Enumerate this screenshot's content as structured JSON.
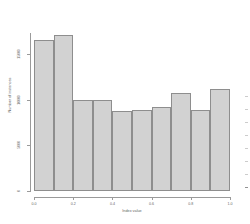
{
  "chart_data": {
    "type": "bar",
    "title": "",
    "subtitle": "",
    "xlabel": "Index value",
    "ylabel": "Number of instances",
    "xlim": [
      0.0,
      1.0
    ],
    "ylim": [
      0,
      20000
    ],
    "grid": false,
    "legend": null,
    "bin_edges": [
      0.0,
      0.1,
      0.2,
      0.3,
      0.4,
      0.5,
      0.6,
      0.7,
      0.8,
      0.9,
      1.0
    ],
    "categories": [
      "0.0-0.1",
      "0.1-0.2",
      "0.2-0.3",
      "0.3-0.4",
      "0.4-0.5",
      "0.5-0.6",
      "0.6-0.7",
      "0.7-0.8",
      "0.8-0.9",
      "0.9-1.0"
    ],
    "values": [
      16500,
      17000,
      9900,
      9900,
      8700,
      8800,
      9200,
      10700,
      8900,
      11100
    ],
    "xticks": [
      0.0,
      0.2,
      0.4,
      0.6,
      0.8,
      1.0
    ],
    "xtick_labels": [
      "0.0",
      "0.2",
      "0.4",
      "0.6",
      "0.8",
      "1.0"
    ],
    "yticks": [
      0,
      5000,
      10000,
      15000
    ],
    "ytick_labels": [
      "0",
      "5000",
      "10000",
      "15000"
    ],
    "bar_color": "#d2d2d2",
    "bar_edge_color": "#8e8e8e",
    "axis_color": "#9a9a9a",
    "text_color": "#666666"
  },
  "gutter": {
    "mark_count": 8
  }
}
